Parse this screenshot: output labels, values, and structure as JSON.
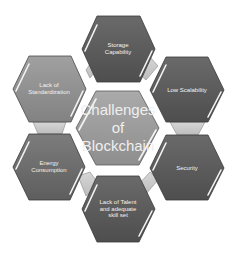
{
  "diagram": {
    "title": "Challenges of Blockchain",
    "center": {
      "label": "Challenges\nof\nBlockchain",
      "color": "#9a9a9a"
    },
    "nodes": [
      {
        "id": "storage",
        "label": "Storage\nCapability",
        "position": "top",
        "color": "#5e5e5e"
      },
      {
        "id": "scalability",
        "label": "Low Scalability",
        "position": "upper-right",
        "color": "#5a5a5a"
      },
      {
        "id": "security",
        "label": "Security",
        "position": "lower-right",
        "color": "#585858"
      },
      {
        "id": "talent",
        "label": "Lack of Talent\nand adequate\nskill set",
        "position": "bottom",
        "color": "#5a5a5a"
      },
      {
        "id": "energy",
        "label": "Energy\nConsumption",
        "position": "lower-left",
        "color": "#6a6a6a"
      },
      {
        "id": "standardization",
        "label": "Lack of\nStandardization",
        "position": "upper-left",
        "color": "#8c8c8c"
      }
    ],
    "connector_color": "#c9c9c9",
    "border_color": "#3a3a3a",
    "highlight_color": "#f4f4f4"
  }
}
